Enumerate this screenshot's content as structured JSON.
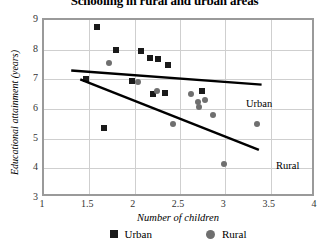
{
  "chart_data": {
    "type": "scatter",
    "title": "Schooling in rural and urban areas",
    "xlabel": "Number of children",
    "ylabel": "Educational attainment (years)",
    "xlim": [
      1,
      4
    ],
    "ylim": [
      3,
      9
    ],
    "xticks": [
      "1",
      "1.5",
      "2",
      "2.5",
      "3",
      "3.5",
      "4"
    ],
    "xtick_values": [
      1,
      1.5,
      2,
      2.5,
      3,
      3.5,
      4
    ],
    "yticks": [
      "3",
      "4",
      "5",
      "6",
      "7",
      "8",
      "9"
    ],
    "ytick_values": [
      3,
      4,
      5,
      6,
      7,
      8,
      9
    ],
    "grid": "both",
    "legend_position": "bottom",
    "series": [
      {
        "name": "Urban",
        "marker": "square",
        "color": "#1a1a1a",
        "inline_label": "Urban",
        "points": [
          [
            1.58,
            8.75
          ],
          [
            1.46,
            7.02
          ],
          [
            1.79,
            8.0
          ],
          [
            2.07,
            7.95
          ],
          [
            2.17,
            7.72
          ],
          [
            2.26,
            7.68
          ],
          [
            2.37,
            7.5
          ],
          [
            1.66,
            5.35
          ],
          [
            1.97,
            6.95
          ],
          [
            2.2,
            6.5
          ],
          [
            2.33,
            6.55
          ],
          [
            2.74,
            6.6
          ]
        ],
        "trendline": {
          "x0": 1.3,
          "y0": 7.3,
          "x1": 3.4,
          "y1": 6.82
        }
      },
      {
        "name": "Rural",
        "marker": "circle",
        "color": "#6f6f6f",
        "inline_label": "Rural",
        "points": [
          [
            1.72,
            7.55
          ],
          [
            2.04,
            6.9
          ],
          [
            2.25,
            6.62
          ],
          [
            2.42,
            5.5
          ],
          [
            2.62,
            6.5
          ],
          [
            2.7,
            6.25
          ],
          [
            2.71,
            6.08
          ],
          [
            2.78,
            6.3
          ],
          [
            2.86,
            5.8
          ],
          [
            2.99,
            4.15
          ],
          [
            3.35,
            5.5
          ]
        ],
        "trendline": {
          "x0": 1.4,
          "y0": 7.0,
          "x1": 3.37,
          "y1": 4.62
        }
      }
    ]
  },
  "legend": {
    "items": [
      {
        "label": "Urban",
        "marker": "square"
      },
      {
        "label": "Rural",
        "marker": "circle"
      }
    ]
  }
}
